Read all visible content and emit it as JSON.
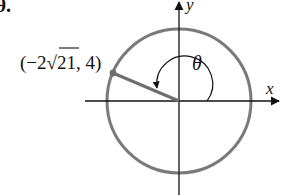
{
  "problem": {
    "number_label": "9."
  },
  "diagram": {
    "point_label": "(−2√21, 4)",
    "point_label_parts": {
      "open": "(−2",
      "radical": "√",
      "radicand": "21",
      "rest": ", 4)"
    },
    "angle_label": "θ",
    "x_axis_label": "x",
    "y_axis_label": "y",
    "point": {
      "x": "-2√21",
      "y": 4
    },
    "colors": {
      "circle": "#7a7a7a",
      "axes": "#111111",
      "terminal_side": "#6e6e6e",
      "text": "#111111"
    }
  }
}
